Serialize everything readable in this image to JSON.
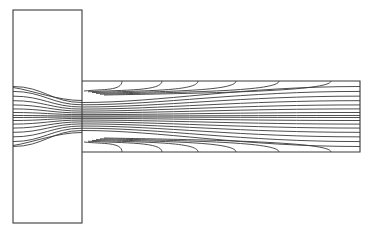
{
  "figure": {
    "type": "contour-plot",
    "colors": {
      "line": "#3a3a3a",
      "background": "#ffffff"
    },
    "geometry": {
      "chamber": {
        "x": 13,
        "y": 10,
        "width": 69,
        "height": 213
      },
      "channel": {
        "x": 82,
        "y": 81,
        "width": 278,
        "height": 71
      },
      "centerline_y": 116.5
    },
    "contours": {
      "channel_arc_endpoints_x": [
        122,
        162,
        198,
        236,
        279,
        331
      ],
      "chamber_entry_count": 14,
      "fan_count": 16
    }
  }
}
